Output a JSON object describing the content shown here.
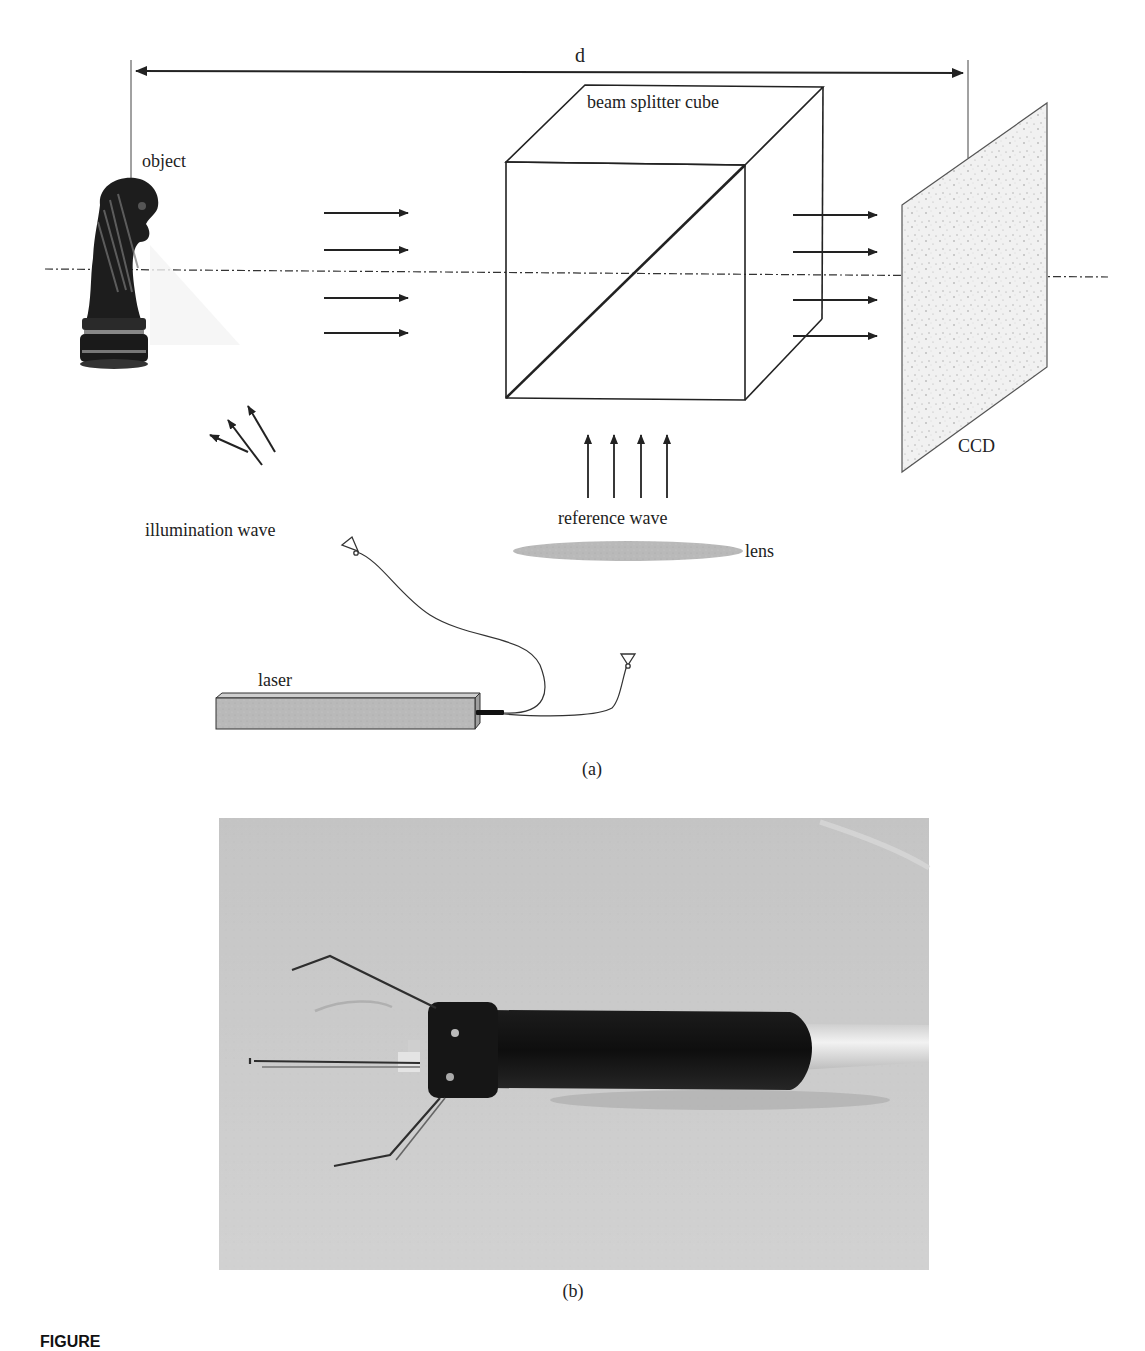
{
  "figure": {
    "panel_a": {
      "label": "(a)",
      "distance_label": "d",
      "object_label": "object",
      "beam_splitter_label": "beam splitter cube",
      "ccd_label": "CCD",
      "illumination_label": "illumination wave",
      "reference_label": "reference wave",
      "lens_label": "lens",
      "laser_label": "laser",
      "object_wave_arrows": 4,
      "output_arrows": 4,
      "reference_arrows": 4,
      "illumination_arrows": 3
    },
    "panel_b": {
      "label": "(b)",
      "photo_description": "photograph of a black cylindrical holographic probe with three wire illumination fibres fanned out at its tip and a light cable exiting the rear"
    },
    "caption_prefix": "FIGURE"
  },
  "colors": {
    "line": "#222222",
    "ccd_fill": "#eeeeee",
    "lens_fill": "#d9d9d9",
    "laser_fill": "#b8b8b8",
    "photo_bg": "#c8c8c8",
    "probe_body": "#141414"
  }
}
